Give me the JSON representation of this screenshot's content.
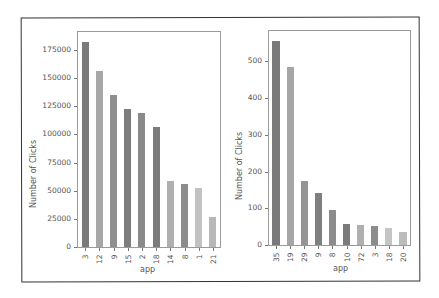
{
  "chart_data": [
    {
      "type": "bar",
      "title": "",
      "xlabel": "app",
      "ylabel": "Number of Clicks",
      "categories": [
        "3",
        "12",
        "9",
        "15",
        "2",
        "18",
        "14",
        "8",
        "1",
        "21"
      ],
      "values": [
        182000,
        156000,
        135000,
        123000,
        119000,
        107000,
        59000,
        56000,
        52000,
        27000
      ],
      "colors": [
        "#7a7a7a",
        "#a6a6a6",
        "#8f8f8f",
        "#7d7d7d",
        "#8a8a8a",
        "#7b7b7b",
        "#b0b0b0",
        "#8c8c8c",
        "#c2c2c2",
        "#b8b8b8"
      ],
      "yticks": [
        0,
        25000,
        50000,
        75000,
        100000,
        125000,
        150000,
        175000
      ],
      "ylim": [
        0,
        191000
      ],
      "grid": false,
      "legend": null
    },
    {
      "type": "bar",
      "title": "",
      "xlabel": "app",
      "ylabel": "Number of Clicks",
      "categories": [
        "35",
        "19",
        "29",
        "9",
        "8",
        "10",
        "72",
        "3",
        "18",
        "20"
      ],
      "values": [
        556,
        484,
        175,
        142,
        95,
        57,
        55,
        51,
        47,
        36
      ],
      "colors": [
        "#7a7a7a",
        "#a6a6a6",
        "#959595",
        "#7f7f7f",
        "#8c8c8c",
        "#7b7b7b",
        "#b0b0b0",
        "#8c8c8c",
        "#c4c4c4",
        "#bcbcbc"
      ],
      "yticks": [
        0,
        100,
        200,
        300,
        400,
        500
      ],
      "ylim": [
        0,
        583
      ],
      "grid": false,
      "legend": null
    }
  ]
}
